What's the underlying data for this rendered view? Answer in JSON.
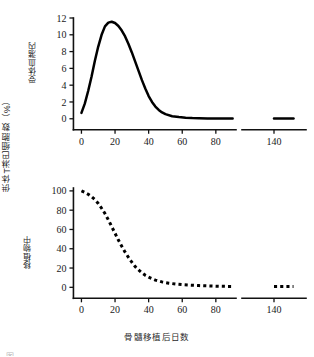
{
  "figure": {
    "outer_y_label": "供体T淋巴细胞数（%）",
    "x_axis_label": "骨髓移植后日数",
    "caption_sliver": "图 　　 　　　　　　　　　　　　"
  },
  "chart_data": [
    {
      "type": "line",
      "panel": "top",
      "title": "",
      "xlabel": "骨髓移植后日数",
      "ylabel": "受体血潴内",
      "xlim": [
        -8,
        92
      ],
      "ylim": [
        -1.1,
        12
      ],
      "grid": false,
      "legend": "none",
      "line_style": "solid",
      "axis_break": {
        "after": 90,
        "resume": 132,
        "resume_end": 148
      },
      "xticks": [
        0,
        20,
        40,
        60,
        80,
        140
      ],
      "xtick_labels": [
        "0",
        "20",
        "40",
        "60",
        "80",
        "140"
      ],
      "yticks": [
        0,
        2,
        4,
        6,
        8,
        10,
        12
      ],
      "ytick_labels": [
        "0",
        "2",
        "4",
        "6",
        "8",
        "10",
        "12"
      ],
      "x": [
        0,
        2,
        4,
        6,
        8,
        10,
        12,
        14,
        16,
        18,
        20,
        22,
        24,
        26,
        28,
        30,
        32,
        34,
        36,
        38,
        40,
        42,
        44,
        46,
        48,
        50,
        54,
        58,
        62,
        66,
        70,
        75,
        80,
        85,
        90
      ],
      "values": [
        0.7,
        1.8,
        3.3,
        5.0,
        6.9,
        8.6,
        10.0,
        11.0,
        11.45,
        11.55,
        11.4,
        11.05,
        10.5,
        9.8,
        8.9,
        7.9,
        6.8,
        5.7,
        4.6,
        3.6,
        2.7,
        2.0,
        1.45,
        1.05,
        0.75,
        0.55,
        0.3,
        0.2,
        0.12,
        0.08,
        0.06,
        0.04,
        0.03,
        0.02,
        0.02
      ],
      "tail_x": [
        140,
        142,
        144,
        146
      ],
      "tail_values": [
        0.02,
        0.02,
        0.02,
        0.02
      ],
      "peak": {
        "x": 18,
        "y": 11.55
      }
    },
    {
      "type": "line",
      "panel": "bottom",
      "title": "",
      "xlabel": "骨髓移植后日数",
      "ylabel": "移植物中",
      "xlim": [
        -8,
        92
      ],
      "ylim": [
        -9,
        103
      ],
      "grid": false,
      "legend": "none",
      "line_style": "dotted",
      "axis_break": {
        "after": 90,
        "resume": 132,
        "resume_end": 148
      },
      "xticks": [
        0,
        20,
        40,
        60,
        80,
        140
      ],
      "xtick_labels": [
        "0",
        "20",
        "40",
        "60",
        "80",
        "140"
      ],
      "yticks": [
        0,
        20,
        40,
        60,
        80,
        100
      ],
      "ytick_labels": [
        "0",
        "20",
        "40",
        "60",
        "80",
        "100"
      ],
      "x": [
        0,
        2,
        4,
        6,
        8,
        10,
        12,
        14,
        16,
        18,
        20,
        22,
        24,
        26,
        28,
        30,
        32,
        34,
        36,
        38,
        40,
        44,
        48,
        52,
        56,
        60,
        65,
        70,
        75,
        80,
        85,
        90
      ],
      "values": [
        100,
        98.5,
        96.5,
        94,
        91,
        87,
        82,
        76.5,
        70,
        63,
        56,
        49,
        42.5,
        36.5,
        31,
        26,
        21.5,
        18,
        15,
        12.5,
        10.5,
        7.5,
        5.6,
        4.3,
        3.4,
        2.8,
        2.2,
        1.8,
        1.5,
        1.2,
        1.0,
        0.9
      ],
      "tail_x": [
        140,
        142,
        144,
        146
      ],
      "tail_values": [
        0.8,
        0.8,
        0.8,
        0.8
      ],
      "start": {
        "x": 0,
        "y": 100
      }
    }
  ]
}
